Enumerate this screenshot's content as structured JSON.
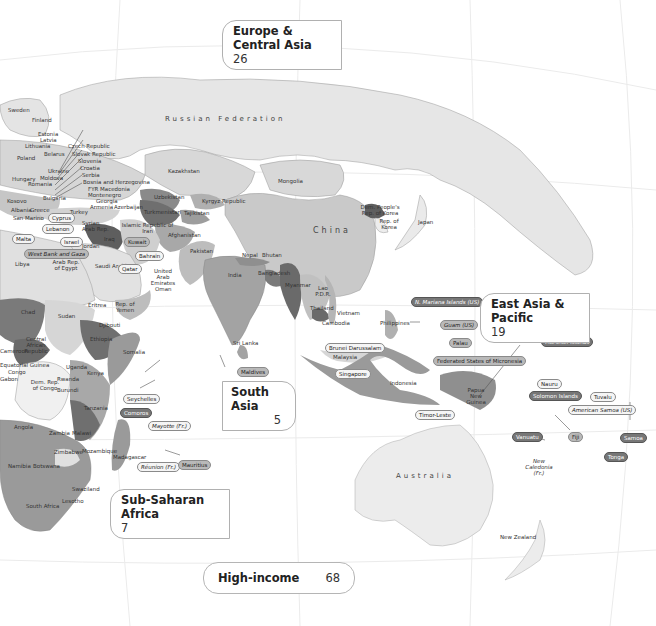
{
  "map": {
    "colors": {
      "ocean": "#ffffff",
      "lightest": "#ececec",
      "light": "#d6d6d6",
      "mid": "#b5b5b5",
      "dark": "#8a8a8a",
      "darkest": "#5e5e5e",
      "grid": "#e8e8e8"
    },
    "large_labels": {
      "russia": "Russian Federation",
      "china": "China",
      "australia": "Australia"
    },
    "country_labels": [
      {
        "key": "sweden",
        "text": "Sweden"
      },
      {
        "key": "finland",
        "text": "Finland"
      },
      {
        "key": "estonia",
        "text": "Estonia"
      },
      {
        "key": "latvia",
        "text": "Latvia"
      },
      {
        "key": "lithuania",
        "text": "Lithuania"
      },
      {
        "key": "czech",
        "text": "Czech Republic"
      },
      {
        "key": "belarus",
        "text": "Belarus"
      },
      {
        "key": "slovak",
        "text": "Slovak Republic"
      },
      {
        "key": "poland",
        "text": "Poland"
      },
      {
        "key": "slovenia",
        "text": "Slovenia"
      },
      {
        "key": "ukraine",
        "text": "Ukraine"
      },
      {
        "key": "croatia",
        "text": "Croatia"
      },
      {
        "key": "hungary",
        "text": "Hungary"
      },
      {
        "key": "moldova",
        "text": "Moldova"
      },
      {
        "key": "serbia",
        "text": "Serbia"
      },
      {
        "key": "romania",
        "text": "Romania"
      },
      {
        "key": "bosnia",
        "text": "Bosnia and Herzegovina"
      },
      {
        "key": "macedonia",
        "text": "FYR Macedonia"
      },
      {
        "key": "montenegro",
        "text": "Montenegro"
      },
      {
        "key": "bulgaria",
        "text": "Bulgaria"
      },
      {
        "key": "georgia",
        "text": "Georgia"
      },
      {
        "key": "armenia",
        "text": "Armenia"
      },
      {
        "key": "azerbaijan",
        "text": "Azerbaijan"
      },
      {
        "key": "kosovo",
        "text": "Kosovo"
      },
      {
        "key": "albania",
        "text": "Albania"
      },
      {
        "key": "greece",
        "text": "Greece"
      },
      {
        "key": "turkey",
        "text": "Turkey"
      },
      {
        "key": "sanmarino",
        "text": "San Marino"
      },
      {
        "key": "syria",
        "text": "Syrian Arab Rep."
      },
      {
        "key": "iraq",
        "text": "Iraq"
      },
      {
        "key": "iran",
        "text": "Islamic Republic of Iran"
      },
      {
        "key": "jordan",
        "text": "Jordan"
      },
      {
        "key": "libya",
        "text": "Libya"
      },
      {
        "key": "egypt",
        "text": "Arab Rep. of Egypt"
      },
      {
        "key": "saudi",
        "text": "Saudi Arabia"
      },
      {
        "key": "uae",
        "text": "United Arab Emirates"
      },
      {
        "key": "oman",
        "text": "Oman"
      },
      {
        "key": "kazakhstan",
        "text": "Kazakhstan"
      },
      {
        "key": "mongolia",
        "text": "Mongolia"
      },
      {
        "key": "uzbekistan",
        "text": "Uzbekistan"
      },
      {
        "key": "turkmenistan",
        "text": "Turkmenistan"
      },
      {
        "key": "kyrgyz",
        "text": "Kyrgyz Republic"
      },
      {
        "key": "tajikistan",
        "text": "Tajikistan"
      },
      {
        "key": "afghanistan",
        "text": "Afghanistan"
      },
      {
        "key": "pakistan",
        "text": "Pakistan"
      },
      {
        "key": "india",
        "text": "India"
      },
      {
        "key": "nepal",
        "text": "Nepal"
      },
      {
        "key": "bhutan",
        "text": "Bhutan"
      },
      {
        "key": "bangladesh",
        "text": "Bangladesh"
      },
      {
        "key": "myanmar",
        "text": "Myanmar"
      },
      {
        "key": "srilanka",
        "text": "Sri Lanka"
      },
      {
        "key": "laos",
        "text": "Lao P.D.R."
      },
      {
        "key": "thailand",
        "text": "Thailand"
      },
      {
        "key": "vietnam",
        "text": "Vietnam"
      },
      {
        "key": "cambodia",
        "text": "Cambodia"
      },
      {
        "key": "philippines",
        "text": "Philippines"
      },
      {
        "key": "malaysia",
        "text": "Malaysia"
      },
      {
        "key": "indonesia",
        "text": "Indonesia"
      },
      {
        "key": "png",
        "text": "Papua New Guinea"
      },
      {
        "key": "nkorea",
        "text": "Dem. People's Rep. of Korea"
      },
      {
        "key": "skorea",
        "text": "Rep. of Korea"
      },
      {
        "key": "japan",
        "text": "Japan"
      },
      {
        "key": "chad",
        "text": "Chad"
      },
      {
        "key": "sudan",
        "text": "Sudan"
      },
      {
        "key": "eritrea",
        "text": "Eritrea"
      },
      {
        "key": "yemen",
        "text": "Rep. of Yemen"
      },
      {
        "key": "djibouti",
        "text": "Djibouti"
      },
      {
        "key": "ethiopia",
        "text": "Ethiopia"
      },
      {
        "key": "somalia",
        "text": "Somalia"
      },
      {
        "key": "car",
        "text": "Central African Republic"
      },
      {
        "key": "cameroon",
        "text": "Cameroon"
      },
      {
        "key": "congo",
        "text": "Congo"
      },
      {
        "key": "gabon",
        "text": "Gabon"
      },
      {
        "key": "eqguinea",
        "text": "Equatorial Guinea"
      },
      {
        "key": "drc",
        "text": "Dem. Rep. of Congo"
      },
      {
        "key": "uganda",
        "text": "Uganda"
      },
      {
        "key": "kenya",
        "text": "Kenya"
      },
      {
        "key": "rwanda",
        "text": "Rwanda"
      },
      {
        "key": "burundi",
        "text": "Burundi"
      },
      {
        "key": "tanzania",
        "text": "Tanzania"
      },
      {
        "key": "angola",
        "text": "Angola"
      },
      {
        "key": "zambia",
        "text": "Zambia"
      },
      {
        "key": "malawi",
        "text": "Malawi"
      },
      {
        "key": "zimbabwe",
        "text": "Zimbabwe"
      },
      {
        "key": "mozambique",
        "text": "Mozambique"
      },
      {
        "key": "madagascar",
        "text": "Madagascar"
      },
      {
        "key": "namibia",
        "text": "Namibia"
      },
      {
        "key": "botswana",
        "text": "Botswana"
      },
      {
        "key": "swaziland",
        "text": "Swaziland"
      },
      {
        "key": "lesotho",
        "text": "Lesotho"
      },
      {
        "key": "southafrica",
        "text": "South Africa"
      },
      {
        "key": "newcaledonia",
        "text": "New Caledonia (Fr.)"
      },
      {
        "key": "newzealand",
        "text": "New Zealand"
      }
    ],
    "callouts": {
      "cyprus": "Cyprus",
      "lebanon": "Lebanon",
      "malta": "Malta",
      "israel": "Israel",
      "westbank": "West Bank and Gaza",
      "kuwait": "Kuwait",
      "bahrain": "Bahrain",
      "qatar": "Qatar",
      "seychelles": "Seychelles",
      "comoros": "Comoros",
      "mayotte": "Mayotte (Fr.)",
      "reunion": "Réunion (Fr.)",
      "mauritius": "Mauritius",
      "maldives": "Maldives",
      "brunei": "Brunei Darussalam",
      "singapore": "Singapore",
      "timorleste": "Timor-Leste",
      "nmariana": "N. Mariana Islands (US)",
      "guam": "Guam (US)",
      "palau": "Palau",
      "micronesia": "Federated States of Micronesia",
      "marshall": "Marshall Islands",
      "nauru": "Nauru",
      "solomon": "Solomon Islands",
      "tuvalu": "Tuvalu",
      "americansamoa": "American Samoa (US)",
      "vanuatu": "Vanuatu",
      "fiji": "Fiji",
      "samoa": "Samoa",
      "tonga": "Tonga"
    }
  },
  "regions": {
    "europe_central_asia": {
      "name": "Europe & Central Asia",
      "count": "26"
    },
    "east_asia_pacific": {
      "name": "East Asia & Pacific",
      "count": "19"
    },
    "south_asia": {
      "name": "South Asia",
      "count": "5"
    },
    "sub_saharan_africa": {
      "name": "Sub-Saharan Africa",
      "count": "7"
    },
    "high_income": {
      "name": "High-income",
      "count": "68"
    }
  }
}
